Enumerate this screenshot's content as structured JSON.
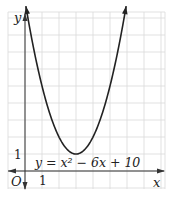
{
  "chart_data": {
    "type": "line",
    "title": "",
    "equation_label": "y = x² − 6x + 10",
    "xlabel": "x",
    "ylabel": "y",
    "origin_label": "O",
    "x_tick_labels": [
      {
        "value": 1,
        "label": "1"
      }
    ],
    "y_tick_labels": [
      {
        "value": 1,
        "label": "1"
      }
    ],
    "xlim": [
      -1,
      8.3
    ],
    "ylim": [
      -1,
      9.4
    ],
    "grid": true,
    "series": [
      {
        "name": "y = x^2 - 6x + 10",
        "x": [
          0.05,
          0.5,
          1,
          1.5,
          2,
          2.5,
          3,
          3.5,
          4,
          4.5,
          5,
          5.5,
          5.95
        ],
        "y": [
          9.7,
          7.25,
          5,
          3.25,
          2,
          1.25,
          1,
          1.25,
          2,
          3.25,
          5,
          7.25,
          9.7
        ]
      }
    ],
    "vertex": {
      "x": 3,
      "y": 1
    }
  },
  "colors": {
    "grid": "#d9d9d9",
    "axis": "#333333",
    "curve": "#222222"
  }
}
